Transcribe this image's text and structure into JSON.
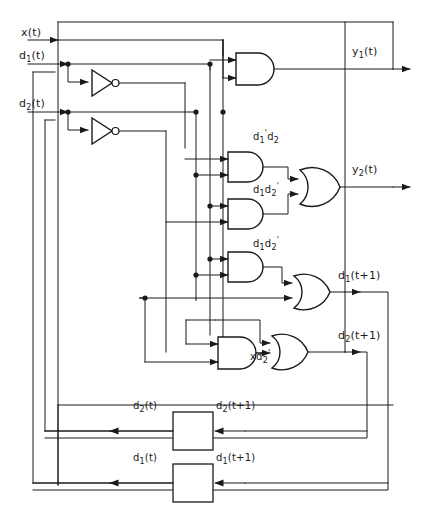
{
  "diagram": {
    "ink_color": "#1a1a1a",
    "background_color": "#ffffff"
  },
  "inputs": [
    {
      "id": "x",
      "label_html": "x(t)",
      "x": 22,
      "y": 28
    },
    {
      "id": "d1",
      "label_html": "d<sub>1</sub>(t)",
      "x": 20,
      "y": 52
    },
    {
      "id": "d2",
      "label_html": "d<sub>2</sub>(t)",
      "x": 20,
      "y": 100
    }
  ],
  "outputs": [
    {
      "id": "y1",
      "label_html": "y<sub>1</sub>(t)",
      "x": 352,
      "y": 47
    },
    {
      "id": "y2",
      "label_html": "y<sub>2</sub>(t)",
      "x": 352,
      "y": 172
    },
    {
      "id": "d1next",
      "label_html": "d<sub>1</sub>(t+1)",
      "x": 340,
      "y": 278
    },
    {
      "id": "d2next",
      "label_html": "d<sub>2</sub>(t+1)",
      "x": 340,
      "y": 330
    }
  ],
  "gate_labels": [
    {
      "id": "and-y1",
      "text_html": "",
      "x": 0,
      "y": 0
    },
    {
      "id": "and-d1p-d2",
      "text_html": "d<sub>1</sub><sup>'</sup>d<sub>2</sub>",
      "x": 258,
      "y": 140
    },
    {
      "id": "and-d1-d2p-upper",
      "text_html": "d<sub>1</sub>d<sub>2</sub><sup>'</sup>",
      "x": 258,
      "y": 190
    },
    {
      "id": "and-d1-d2p-lower",
      "text_html": "d<sub>1</sub>d<sub>2</sub><sup>'</sup>",
      "x": 258,
      "y": 243
    },
    {
      "id": "and-x-d2p",
      "text_html": "xd<sub>2</sub><sup>'</sup>",
      "x": 257,
      "y": 355
    }
  ],
  "flipflops": [
    {
      "id": "ff-d2",
      "input_label_html": "d<sub>2</sub>(t+1)",
      "output_label_html": "d<sub>2</sub>(t)",
      "input_label_x": 216,
      "input_label_y": 404,
      "output_label_x": 133,
      "output_label_y": 404,
      "box": {
        "x": 173,
        "y": 412,
        "w": 40,
        "h": 38
      }
    },
    {
      "id": "ff-d1",
      "input_label_html": "d<sub>1</sub>(t+1)",
      "output_label_html": "d<sub>1</sub>(t)",
      "input_label_x": 216,
      "input_label_y": 456,
      "output_label_x": 133,
      "output_label_y": 456,
      "box": {
        "x": 173,
        "y": 464,
        "w": 40,
        "h": 38
      }
    }
  ],
  "components": {
    "and_gates": 5,
    "or_gates": 3,
    "inverters": 2,
    "delay_elements": 2
  }
}
